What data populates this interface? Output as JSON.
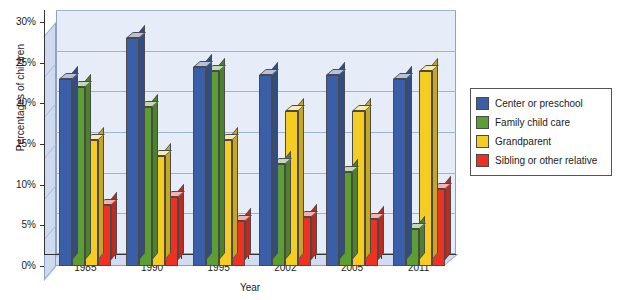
{
  "chart_data": {
    "type": "bar",
    "title": "",
    "xlabel": "Year",
    "ylabel": "Percentages of children",
    "categories": [
      "1985",
      "1990",
      "1995",
      "2002",
      "2005",
      "2011"
    ],
    "ylim": [
      0,
      30
    ],
    "ytick_labels": [
      "0%",
      "5%",
      "10%",
      "15%",
      "20%",
      "25%",
      "30%"
    ],
    "ytick_values": [
      0,
      5,
      10,
      15,
      20,
      25,
      30
    ],
    "grid": true,
    "legend_position": "right",
    "series": [
      {
        "name": "Center or preschool",
        "color": "#3b5ea8",
        "values": [
          23.0,
          28.0,
          24.5,
          23.5,
          23.5,
          23.0
        ]
      },
      {
        "name": "Family child care",
        "color": "#5d9e32",
        "values": [
          22.0,
          19.5,
          24.0,
          12.5,
          11.5,
          4.5
        ]
      },
      {
        "name": "Grandparent",
        "color": "#f5cc22",
        "values": [
          15.5,
          13.5,
          15.5,
          19.0,
          19.0,
          24.0
        ]
      },
      {
        "name": "Sibling or other relative",
        "color": "#ed3224",
        "values": [
          7.5,
          8.5,
          5.5,
          6.0,
          5.8,
          9.5
        ]
      }
    ]
  }
}
